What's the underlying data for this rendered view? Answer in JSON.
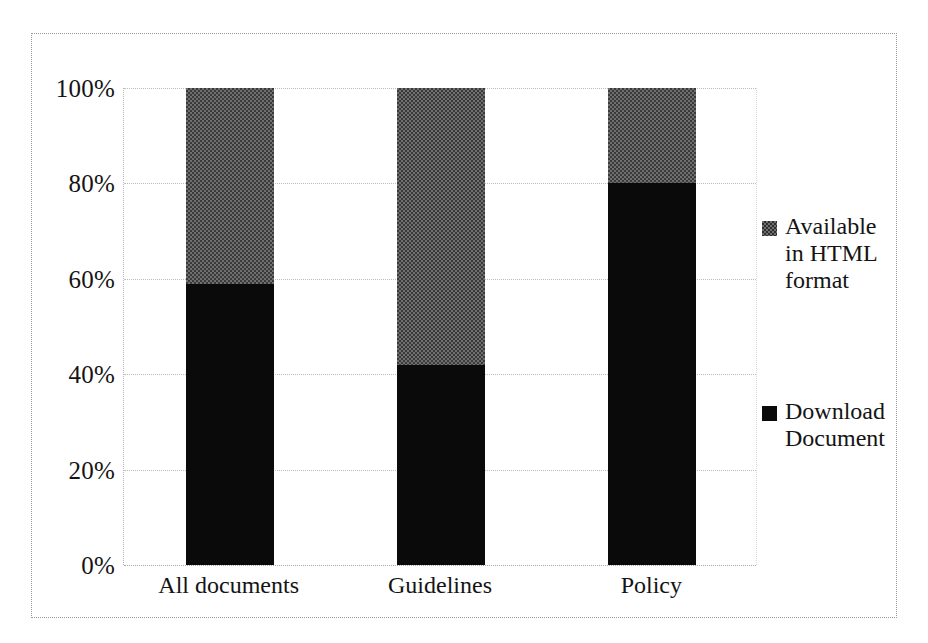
{
  "chart_data": {
    "type": "bar",
    "subtype": "stacked-percentage",
    "title": "",
    "subtitle": "",
    "xlabel": "",
    "ylabel": "",
    "categories": [
      "All documents",
      "Guidelines",
      "Policy"
    ],
    "series": [
      {
        "name": "Download Document",
        "color": "#0a0a0a",
        "values": [
          59,
          42,
          80
        ]
      },
      {
        "name": "Available in HTML format",
        "color": "#6f6f6f",
        "values": [
          41,
          58,
          20
        ]
      }
    ],
    "ylim": [
      0,
      100
    ],
    "ytick_values": [
      100,
      80,
      60,
      40,
      20,
      0
    ],
    "ytick_labels": [
      "100%",
      "80%",
      "60%",
      "40%",
      "20%",
      "0%"
    ],
    "grid": true,
    "grid_axis": "y",
    "legend_position": "right",
    "legend": [
      {
        "label": "Available in HTML format",
        "marker": "square",
        "color": "#6f6f6f"
      },
      {
        "label": "Download Document",
        "marker": "square",
        "color": "#0a0a0a"
      }
    ]
  },
  "axes": {
    "y_ticks": [
      {
        "label": "100%",
        "value": 100
      },
      {
        "label": "80%",
        "value": 80
      },
      {
        "label": "60%",
        "value": 60
      },
      {
        "label": "40%",
        "value": 40
      },
      {
        "label": "20%",
        "value": 20
      },
      {
        "label": "0%",
        "value": 0
      }
    ],
    "x_ticks": [
      {
        "label": "All documents"
      },
      {
        "label": "Guidelines"
      },
      {
        "label": "Policy"
      }
    ]
  },
  "legend": {
    "entries": [
      {
        "label": "Available in HTML format",
        "swatch": "gray"
      },
      {
        "label": "Download Document",
        "swatch": "black"
      }
    ]
  },
  "colors": {
    "bar_black": "#0a0a0a",
    "bar_gray": "#6f6f6f",
    "gridline": "#bdbdbd",
    "frame": "#9a9a9a",
    "text": "#141414",
    "background": "#ffffff"
  }
}
